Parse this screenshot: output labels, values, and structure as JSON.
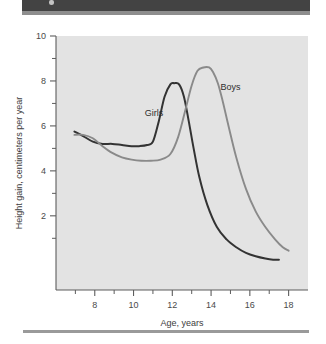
{
  "figure": {
    "header_band": "",
    "footer_rule": ""
  },
  "chart_data": {
    "type": "line",
    "title": "",
    "subtitle": "",
    "xlabel": "Age, years",
    "ylabel": "Height gain, centimeters per year",
    "xlim": [
      6,
      19
    ],
    "ylim": [
      -1.3,
      10
    ],
    "xticks": [
      8,
      10,
      12,
      14,
      16,
      18
    ],
    "xtick_labels": [
      "8",
      "10",
      "12",
      "14",
      "16",
      "18"
    ],
    "x_minor_ticks": [
      7,
      9,
      11,
      13,
      15,
      17
    ],
    "yticks": [
      2,
      4,
      6,
      8,
      10
    ],
    "ytick_labels": [
      "2",
      "4",
      "6",
      "8",
      "10"
    ],
    "y_minor_ticks": [
      1,
      3,
      5,
      7,
      9
    ],
    "grid": false,
    "legend_position": "inline-annotation",
    "panel_background": "#e3e3e3",
    "series": [
      {
        "name": "Girls",
        "color": "#333333",
        "label_x": 11.05,
        "label_y": 6.45,
        "x": [
          6.95,
          7.4,
          7.9,
          8.4,
          8.9,
          9.4,
          9.9,
          10.3,
          10.7,
          11.0,
          11.3,
          11.6,
          11.9,
          12.1,
          12.35,
          12.6,
          12.85,
          13.1,
          13.4,
          13.8,
          14.3,
          14.8,
          15.3,
          15.8,
          16.3,
          16.8,
          17.2,
          17.5
        ],
        "y": [
          5.75,
          5.55,
          5.3,
          5.2,
          5.2,
          5.15,
          5.1,
          5.1,
          5.15,
          5.3,
          6.2,
          7.3,
          7.85,
          7.9,
          7.85,
          7.3,
          6.2,
          5.0,
          3.7,
          2.5,
          1.5,
          0.95,
          0.6,
          0.35,
          0.2,
          0.1,
          0.05,
          0.05
        ]
      },
      {
        "name": "Boys",
        "color": "#8a8a8a",
        "label_x": 15.0,
        "label_y": 7.6,
        "x": [
          6.95,
          7.4,
          7.9,
          8.4,
          8.9,
          9.4,
          9.9,
          10.4,
          10.9,
          11.4,
          11.9,
          12.3,
          12.7,
          13.0,
          13.3,
          13.6,
          13.9,
          14.1,
          14.35,
          14.6,
          14.9,
          15.3,
          15.8,
          16.3,
          16.8,
          17.3,
          17.7,
          18.0
        ],
        "y": [
          5.6,
          5.6,
          5.45,
          5.1,
          4.8,
          4.6,
          4.5,
          4.45,
          4.45,
          4.5,
          4.75,
          5.5,
          6.8,
          7.8,
          8.45,
          8.6,
          8.6,
          8.4,
          7.9,
          7.1,
          6.0,
          4.6,
          3.2,
          2.2,
          1.5,
          0.95,
          0.6,
          0.45
        ]
      }
    ]
  }
}
